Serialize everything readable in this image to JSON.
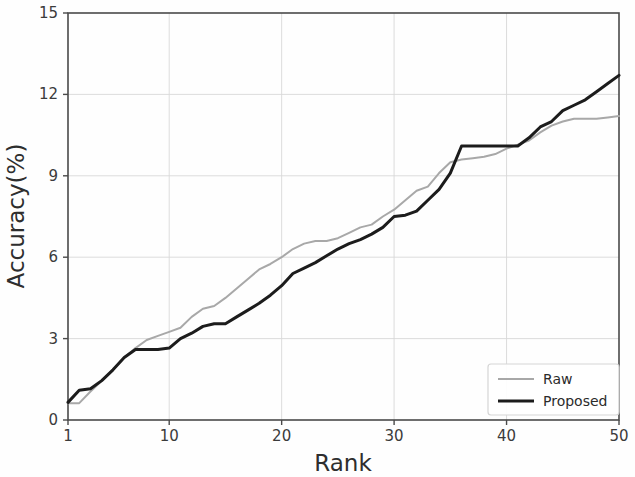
{
  "chart_data": {
    "type": "line",
    "title": "",
    "xlabel": "Rank",
    "ylabel": "Accuracy(%)",
    "xlim": [
      1,
      50
    ],
    "ylim": [
      0,
      15
    ],
    "xticks": [
      1,
      10,
      20,
      30,
      40,
      50
    ],
    "xtick_labels": [
      "1",
      "10",
      "20",
      "30",
      "40",
      "50"
    ],
    "yticks": [
      0,
      3,
      6,
      9,
      12,
      15
    ],
    "ytick_labels": [
      "0",
      "3",
      "6",
      "9",
      "12",
      "15"
    ],
    "grid": true,
    "grid_color": "#d8d8d8",
    "legend_position": "lower right",
    "x": [
      1,
      2,
      3,
      4,
      5,
      6,
      7,
      8,
      9,
      10,
      11,
      12,
      13,
      14,
      15,
      16,
      17,
      18,
      19,
      20,
      21,
      22,
      23,
      24,
      25,
      26,
      27,
      28,
      29,
      30,
      31,
      32,
      33,
      34,
      35,
      36,
      37,
      38,
      39,
      40,
      41,
      42,
      43,
      44,
      45,
      46,
      47,
      48,
      49,
      50
    ],
    "series": [
      {
        "name": "Raw",
        "color": "#a8a8a8",
        "linewidth": 2.0,
        "values": [
          0.62,
          0.62,
          1.05,
          1.45,
          1.85,
          2.3,
          2.65,
          2.95,
          3.1,
          3.25,
          3.4,
          3.8,
          4.1,
          4.2,
          4.5,
          4.85,
          5.2,
          5.55,
          5.75,
          6.0,
          6.3,
          6.5,
          6.6,
          6.6,
          6.7,
          6.9,
          7.1,
          7.2,
          7.5,
          7.75,
          8.1,
          8.45,
          8.6,
          9.1,
          9.5,
          9.6,
          9.65,
          9.7,
          9.8,
          10.0,
          10.15,
          10.3,
          10.6,
          10.85,
          11.0,
          11.1,
          11.1,
          11.1,
          11.15,
          11.2
        ]
      },
      {
        "name": "Proposed",
        "color": "#1c1c1c",
        "linewidth": 3.0,
        "values": [
          0.65,
          1.1,
          1.15,
          1.45,
          1.85,
          2.3,
          2.6,
          2.6,
          2.6,
          2.65,
          3.0,
          3.2,
          3.45,
          3.55,
          3.55,
          3.8,
          4.05,
          4.3,
          4.6,
          4.95,
          5.4,
          5.6,
          5.8,
          6.05,
          6.3,
          6.5,
          6.65,
          6.85,
          7.1,
          7.5,
          7.55,
          7.7,
          8.1,
          8.5,
          9.1,
          10.1,
          10.1,
          10.1,
          10.1,
          10.1,
          10.1,
          10.4,
          10.8,
          11.0,
          11.4,
          11.6,
          11.8,
          12.1,
          12.4,
          12.7
        ]
      }
    ]
  },
  "legend": {
    "entries": [
      {
        "label": "Raw"
      },
      {
        "label": "Proposed"
      }
    ]
  }
}
